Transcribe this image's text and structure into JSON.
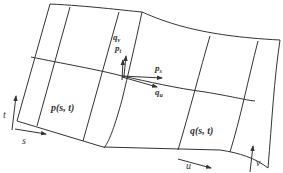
{
  "diagram": {
    "type": "parametric-surface-patches",
    "colors": {
      "line": "#333333",
      "background": "#ffffff"
    },
    "patches": [
      {
        "name": "p",
        "label": "p(s, t)",
        "param_axes": {
          "horizontal": "s",
          "vertical": "t"
        }
      },
      {
        "name": "q",
        "label": "q(s, t)",
        "param_axes": {
          "horizontal": "u",
          "vertical": "v"
        }
      }
    ],
    "vectors": {
      "p_t": {
        "base": "p",
        "sub": "t"
      },
      "q_v": {
        "base": "q",
        "sub": "v"
      },
      "p_s": {
        "base": "p",
        "sub": "s"
      },
      "q_u": {
        "base": "q",
        "sub": "u"
      }
    },
    "axis_labels": {
      "t": "t",
      "s": "s",
      "u": "u",
      "v": "v"
    }
  }
}
